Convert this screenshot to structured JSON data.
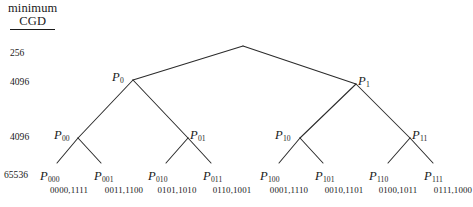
{
  "figure": {
    "header": {
      "line1": "minimum",
      "line2": "CGD"
    },
    "cgd_levels": [
      {
        "value": "256",
        "x": 10,
        "y": 47
      },
      {
        "value": "4096",
        "x": 10,
        "y": 76
      },
      {
        "value": "4096",
        "x": 10,
        "y": 131
      },
      {
        "value": "65536",
        "x": 4,
        "y": 169
      }
    ],
    "root": {
      "x": 243,
      "y": 46
    },
    "nodes": [
      {
        "name": "P",
        "sub": "0",
        "nx": 133,
        "ny": 80,
        "lx": 112,
        "ly": 70
      },
      {
        "name": "P",
        "sub": "1",
        "nx": 356,
        "ny": 84,
        "lx": 358,
        "ly": 74
      },
      {
        "name": "P",
        "sub": "00",
        "nx": 78,
        "ny": 138,
        "lx": 54,
        "ly": 128
      },
      {
        "name": "P",
        "sub": "01",
        "nx": 188,
        "ny": 138,
        "lx": 190,
        "ly": 128
      },
      {
        "name": "P",
        "sub": "10",
        "nx": 300,
        "ny": 138,
        "lx": 275,
        "ly": 128
      },
      {
        "name": "P",
        "sub": "11",
        "nx": 410,
        "ny": 138,
        "lx": 412,
        "ly": 128
      }
    ],
    "leaves": [
      {
        "name": "P",
        "sub": "000",
        "bits": "0000,1111",
        "nx": 57,
        "ny": 163,
        "lx": 40,
        "ly": 169,
        "bx": 69,
        "by": 185
      },
      {
        "name": "P",
        "sub": "001",
        "bits": "0011,1100",
        "nx": 101,
        "ny": 163,
        "lx": 94,
        "ly": 169,
        "bx": 124,
        "by": 185
      },
      {
        "name": "P",
        "sub": "010",
        "bits": "0101,1010",
        "nx": 166,
        "ny": 163,
        "lx": 148,
        "ly": 169,
        "bx": 177,
        "by": 185
      },
      {
        "name": "P",
        "sub": "011",
        "bits": "0110,1001",
        "nx": 211,
        "ny": 163,
        "lx": 203,
        "ly": 169,
        "bx": 232,
        "by": 185
      },
      {
        "name": "P",
        "sub": "100",
        "bits": "0001,1110",
        "nx": 279,
        "ny": 163,
        "lx": 260,
        "ly": 169,
        "bx": 289,
        "by": 185
      },
      {
        "name": "P",
        "sub": "101",
        "bits": "0010,1101",
        "nx": 323,
        "ny": 163,
        "lx": 315,
        "ly": 169,
        "bx": 344,
        "by": 185
      },
      {
        "name": "P",
        "sub": "110",
        "bits": "0100,1011",
        "nx": 388,
        "ny": 163,
        "lx": 369,
        "ly": 169,
        "bx": 398,
        "by": 185
      },
      {
        "name": "P",
        "sub": "111",
        "bits": "0111,1000",
        "nx": 433,
        "ny": 163,
        "lx": 424,
        "ly": 169,
        "bx": 453,
        "by": 185
      }
    ],
    "edges": [
      {
        "from": "root",
        "to": "P0",
        "x1": 243,
        "y1": 46,
        "x2": 133,
        "y2": 80
      },
      {
        "from": "root",
        "to": "P1",
        "x1": 243,
        "y1": 46,
        "x2": 356,
        "y2": 84
      },
      {
        "from": "P0",
        "to": "P00",
        "x1": 133,
        "y1": 80,
        "x2": 78,
        "y2": 138
      },
      {
        "from": "P0",
        "to": "P01",
        "x1": 133,
        "y1": 80,
        "x2": 188,
        "y2": 138
      },
      {
        "from": "P1",
        "to": "P10",
        "x1": 356,
        "y1": 84,
        "x2": 300,
        "y2": 138
      },
      {
        "from": "P1",
        "to": "P11",
        "x1": 356,
        "y1": 84,
        "x2": 410,
        "y2": 138
      },
      {
        "from": "P00",
        "to": "P000",
        "x1": 78,
        "y1": 138,
        "x2": 57,
        "y2": 163
      },
      {
        "from": "P00",
        "to": "P001",
        "x1": 78,
        "y1": 138,
        "x2": 101,
        "y2": 163
      },
      {
        "from": "P01",
        "to": "P010",
        "x1": 188,
        "y1": 138,
        "x2": 166,
        "y2": 163
      },
      {
        "from": "P01",
        "to": "P011",
        "x1": 188,
        "y1": 138,
        "x2": 211,
        "y2": 163
      },
      {
        "from": "P10",
        "to": "P100",
        "x1": 300,
        "y1": 138,
        "x2": 279,
        "y2": 163
      },
      {
        "from": "P10",
        "to": "P101",
        "x1": 300,
        "y1": 138,
        "x2": 323,
        "y2": 163
      },
      {
        "from": "P11",
        "to": "P110",
        "x1": 410,
        "y1": 138,
        "x2": 388,
        "y2": 163
      },
      {
        "from": "P11",
        "to": "P111",
        "x1": 410,
        "y1": 138,
        "x2": 433,
        "y2": 163
      }
    ],
    "style": {
      "line_color": "#2b2b2b",
      "text_color": "#1a1a1a",
      "background": "#ffffff"
    }
  }
}
